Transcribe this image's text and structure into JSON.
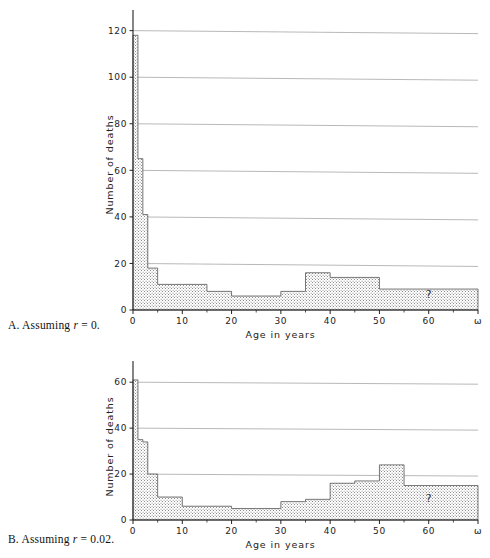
{
  "figure": {
    "background": "#ffffff",
    "ink": "#222222",
    "gridline_color": "#9a9a9a",
    "fill_color": "#d9d9d9",
    "fill_pattern": "stipple"
  },
  "panels": [
    {
      "id": "A",
      "caption_prefix": "A.",
      "caption_text": "Assuming",
      "caption_symbol": "r",
      "caption_value": "= 0.",
      "caption_full": "A. Assuming r = 0.",
      "xlabel": "Age in years",
      "ylabel": "Number of deaths",
      "unknown_marker": "?",
      "yticks": [
        0,
        20,
        40,
        60,
        80,
        100,
        120
      ],
      "ytick_labels": [
        "0",
        "20",
        "40",
        "60",
        "80",
        "100",
        "120"
      ],
      "xticks": [
        0,
        10,
        20,
        30,
        40,
        50,
        60,
        70
      ],
      "xtick_labels": [
        "0",
        "10",
        "20",
        "30",
        "40",
        "50",
        "60",
        "ω"
      ],
      "xminor": [
        5,
        15,
        25,
        35,
        45,
        55,
        65
      ]
    },
    {
      "id": "B",
      "caption_prefix": "B.",
      "caption_text": "Assuming",
      "caption_symbol": "r",
      "caption_value": "= 0.02.",
      "caption_full": "B. Assuming r = 0.02.",
      "xlabel": "Age in years",
      "ylabel": "Number of deaths",
      "unknown_marker": "?",
      "yticks": [
        0,
        20,
        40,
        60
      ],
      "ytick_labels": [
        "0",
        "20",
        "40",
        "60"
      ],
      "xticks": [
        0,
        10,
        20,
        30,
        40,
        50,
        60,
        70
      ],
      "xtick_labels": [
        "0",
        "10",
        "20",
        "30",
        "40",
        "50",
        "60",
        "ω"
      ],
      "xminor": [
        5,
        15,
        25,
        35,
        45,
        55,
        65
      ]
    }
  ],
  "chart_data": [
    {
      "type": "bar",
      "id": "A",
      "title": "A. Assuming r = 0.",
      "xlabel": "Age in years",
      "ylabel": "Number of deaths",
      "xlim": [
        0,
        70
      ],
      "ylim": [
        0,
        125
      ],
      "grid": true,
      "legend": null,
      "annotations": [
        {
          "text": "?",
          "x": 60,
          "y": 5
        }
      ],
      "bins": [
        {
          "x0": 0,
          "x1": 1,
          "value": 118
        },
        {
          "x0": 1,
          "x1": 2,
          "value": 65
        },
        {
          "x0": 2,
          "x1": 3,
          "value": 41
        },
        {
          "x0": 3,
          "x1": 5,
          "value": 18
        },
        {
          "x0": 5,
          "x1": 10,
          "value": 11
        },
        {
          "x0": 10,
          "x1": 15,
          "value": 11
        },
        {
          "x0": 15,
          "x1": 20,
          "value": 8
        },
        {
          "x0": 20,
          "x1": 25,
          "value": 6
        },
        {
          "x0": 25,
          "x1": 30,
          "value": 6
        },
        {
          "x0": 30,
          "x1": 35,
          "value": 8
        },
        {
          "x0": 35,
          "x1": 40,
          "value": 16
        },
        {
          "x0": 40,
          "x1": 45,
          "value": 14
        },
        {
          "x0": 45,
          "x1": 50,
          "value": 14
        },
        {
          "x0": 50,
          "x1": 70,
          "value": 9
        }
      ]
    },
    {
      "type": "bar",
      "id": "B",
      "title": "B. Assuming r = 0.02.",
      "xlabel": "Age in years",
      "ylabel": "Number of deaths",
      "xlim": [
        0,
        70
      ],
      "ylim": [
        0,
        64
      ],
      "grid": true,
      "legend": null,
      "annotations": [
        {
          "text": "?",
          "x": 60,
          "y": 8
        }
      ],
      "bins": [
        {
          "x0": 0,
          "x1": 1,
          "value": 61
        },
        {
          "x0": 1,
          "x1": 2,
          "value": 35
        },
        {
          "x0": 2,
          "x1": 3,
          "value": 34
        },
        {
          "x0": 3,
          "x1": 5,
          "value": 20
        },
        {
          "x0": 5,
          "x1": 10,
          "value": 10
        },
        {
          "x0": 10,
          "x1": 15,
          "value": 6
        },
        {
          "x0": 15,
          "x1": 20,
          "value": 6
        },
        {
          "x0": 20,
          "x1": 25,
          "value": 5
        },
        {
          "x0": 25,
          "x1": 30,
          "value": 5
        },
        {
          "x0": 30,
          "x1": 35,
          "value": 8
        },
        {
          "x0": 35,
          "x1": 40,
          "value": 9
        },
        {
          "x0": 40,
          "x1": 45,
          "value": 16
        },
        {
          "x0": 45,
          "x1": 50,
          "value": 17
        },
        {
          "x0": 50,
          "x1": 55,
          "value": 24
        },
        {
          "x0": 55,
          "x1": 70,
          "value": 15
        }
      ]
    }
  ]
}
